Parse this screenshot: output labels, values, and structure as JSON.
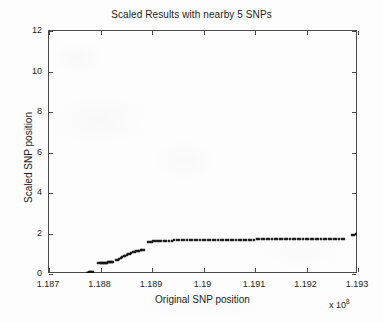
{
  "figure": {
    "background_color": "#fdfdfd",
    "axis_color": "#4a4a4a",
    "marker_color": "#141414"
  },
  "chart_data": {
    "type": "scatter",
    "title": "Scaled Results with nearby 5 SNPs",
    "xlabel": "Original SNP position",
    "ylabel": "Scaled SNP position",
    "x_exponent_label": "x 10",
    "x_exponent_power": "8",
    "xlim": [
      1.187,
      1.193
    ],
    "ylim": [
      0,
      12
    ],
    "xticks": [
      1.187,
      1.188,
      1.189,
      1.19,
      1.191,
      1.192,
      1.193
    ],
    "xticklabels": [
      "1.187",
      "1.188",
      "1.189",
      "1.19",
      "1.191",
      "1.192",
      "1.193"
    ],
    "yticks": [
      0,
      2,
      4,
      6,
      8,
      10,
      12
    ],
    "yticklabels": [
      "0",
      "2",
      "4",
      "6",
      "8",
      "10",
      "12"
    ],
    "grid": false,
    "legend": null,
    "marker": "x",
    "series": [
      {
        "name": "Scaled SNP position",
        "points": [
          [
            1.18776,
            0.02
          ],
          [
            1.18778,
            0.02
          ],
          [
            1.1878,
            0.03
          ],
          [
            1.18782,
            0.03
          ],
          [
            1.18784,
            0.04
          ],
          [
            1.18786,
            0.04
          ],
          [
            1.18788,
            0.05
          ],
          [
            1.18798,
            0.47
          ],
          [
            1.188,
            0.48
          ],
          [
            1.18802,
            0.48
          ],
          [
            1.18804,
            0.49
          ],
          [
            1.18806,
            0.49
          ],
          [
            1.18808,
            0.5
          ],
          [
            1.1881,
            0.5
          ],
          [
            1.18812,
            0.51
          ],
          [
            1.18814,
            0.51
          ],
          [
            1.18816,
            0.52
          ],
          [
            1.18818,
            0.52
          ],
          [
            1.1882,
            0.53
          ],
          [
            1.18822,
            0.53
          ],
          [
            1.18824,
            0.54
          ],
          [
            1.18826,
            0.54
          ],
          [
            1.18832,
            0.62
          ],
          [
            1.18835,
            0.66
          ],
          [
            1.18838,
            0.7
          ],
          [
            1.18841,
            0.74
          ],
          [
            1.18844,
            0.78
          ],
          [
            1.18847,
            0.82
          ],
          [
            1.1885,
            0.86
          ],
          [
            1.18853,
            0.89
          ],
          [
            1.18856,
            0.92
          ],
          [
            1.18859,
            0.96
          ],
          [
            1.18862,
            1.0
          ],
          [
            1.18865,
            1.03
          ],
          [
            1.18868,
            1.06
          ],
          [
            1.18871,
            1.08
          ],
          [
            1.18874,
            1.1
          ],
          [
            1.18877,
            1.11
          ],
          [
            1.1888,
            1.12
          ],
          [
            1.18883,
            1.13
          ],
          [
            1.18886,
            1.13
          ],
          [
            1.18895,
            1.52
          ],
          [
            1.18898,
            1.54
          ],
          [
            1.18901,
            1.55
          ],
          [
            1.18904,
            1.56
          ],
          [
            1.18908,
            1.57
          ],
          [
            1.18912,
            1.58
          ],
          [
            1.18916,
            1.58
          ],
          [
            1.1892,
            1.59
          ],
          [
            1.18925,
            1.59
          ],
          [
            1.1893,
            1.6
          ],
          [
            1.18935,
            1.6
          ],
          [
            1.1894,
            1.6
          ],
          [
            1.18945,
            1.61
          ],
          [
            1.1895,
            1.61
          ],
          [
            1.18955,
            1.61
          ],
          [
            1.1896,
            1.61
          ],
          [
            1.18965,
            1.62
          ],
          [
            1.1897,
            1.62
          ],
          [
            1.18975,
            1.62
          ],
          [
            1.1898,
            1.62
          ],
          [
            1.18985,
            1.62
          ],
          [
            1.1899,
            1.62
          ],
          [
            1.18995,
            1.63
          ],
          [
            1.19,
            1.63
          ],
          [
            1.19005,
            1.63
          ],
          [
            1.1901,
            1.63
          ],
          [
            1.19015,
            1.63
          ],
          [
            1.1902,
            1.63
          ],
          [
            1.19025,
            1.63
          ],
          [
            1.1903,
            1.64
          ],
          [
            1.19035,
            1.64
          ],
          [
            1.1904,
            1.64
          ],
          [
            1.19045,
            1.64
          ],
          [
            1.1905,
            1.64
          ],
          [
            1.19055,
            1.64
          ],
          [
            1.1906,
            1.64
          ],
          [
            1.19065,
            1.65
          ],
          [
            1.1907,
            1.65
          ],
          [
            1.19075,
            1.65
          ],
          [
            1.1908,
            1.65
          ],
          [
            1.19085,
            1.65
          ],
          [
            1.1909,
            1.65
          ],
          [
            1.19095,
            1.65
          ],
          [
            1.191,
            1.65
          ],
          [
            1.19105,
            1.66
          ],
          [
            1.1911,
            1.66
          ],
          [
            1.19115,
            1.66
          ],
          [
            1.1912,
            1.66
          ],
          [
            1.19125,
            1.66
          ],
          [
            1.1913,
            1.66
          ],
          [
            1.19135,
            1.66
          ],
          [
            1.1914,
            1.66
          ],
          [
            1.19145,
            1.67
          ],
          [
            1.1915,
            1.67
          ],
          [
            1.19155,
            1.67
          ],
          [
            1.1916,
            1.67
          ],
          [
            1.19165,
            1.67
          ],
          [
            1.1917,
            1.67
          ],
          [
            1.19175,
            1.68
          ],
          [
            1.1918,
            1.68
          ],
          [
            1.19185,
            1.68
          ],
          [
            1.1919,
            1.68
          ],
          [
            1.19195,
            1.68
          ],
          [
            1.192,
            1.68
          ],
          [
            1.19205,
            1.68
          ],
          [
            1.1921,
            1.69
          ],
          [
            1.19215,
            1.69
          ],
          [
            1.1922,
            1.69
          ],
          [
            1.19225,
            1.69
          ],
          [
            1.1923,
            1.69
          ],
          [
            1.19235,
            1.69
          ],
          [
            1.1924,
            1.69
          ],
          [
            1.19245,
            1.7
          ],
          [
            1.1925,
            1.7
          ],
          [
            1.19255,
            1.7
          ],
          [
            1.1926,
            1.7
          ],
          [
            1.19265,
            1.7
          ],
          [
            1.1927,
            1.7
          ],
          [
            1.19275,
            1.7
          ],
          [
            1.1929,
            1.88
          ],
          [
            1.19294,
            1.9
          ],
          [
            1.19298,
            1.91
          ],
          [
            1.19302,
            1.92
          ],
          [
            1.19306,
            1.93
          ],
          [
            1.1931,
            1.94
          ],
          [
            1.19314,
            1.95
          ],
          [
            1.19318,
            1.96
          ],
          [
            1.1933,
            2.08
          ],
          [
            1.19334,
            2.09
          ],
          [
            1.19338,
            2.1
          ],
          [
            1.19342,
            2.11
          ],
          [
            1.19346,
            2.11
          ],
          [
            1.1935,
            2.12
          ],
          [
            1.19355,
            2.12
          ],
          [
            1.1936,
            2.13
          ],
          [
            1.19365,
            2.13
          ],
          [
            1.1937,
            2.13
          ],
          [
            1.19375,
            2.14
          ],
          [
            1.1938,
            2.14
          ],
          [
            1.19385,
            2.14
          ],
          [
            1.1939,
            2.14
          ],
          [
            1.1941,
            2.62
          ],
          [
            1.19418,
            2.8
          ],
          [
            1.19428,
            2.92
          ],
          [
            1.19432,
            2.94
          ],
          [
            1.19436,
            2.95
          ],
          [
            1.1944,
            2.96
          ],
          [
            1.19444,
            2.97
          ],
          [
            1.19448,
            2.97
          ],
          [
            1.19452,
            2.98
          ],
          [
            1.19456,
            2.98
          ],
          [
            1.19448,
            3.18
          ],
          [
            1.1949,
            4.06
          ],
          [
            1.19494,
            4.08
          ],
          [
            1.19498,
            4.09
          ],
          [
            1.19502,
            4.1
          ],
          [
            1.19506,
            4.11
          ],
          [
            1.1951,
            4.11
          ],
          [
            1.1953,
            4.55
          ],
          [
            1.19535,
            4.57
          ],
          [
            1.1954,
            4.58
          ],
          [
            1.19545,
            4.59
          ],
          [
            1.1955,
            4.6
          ],
          [
            1.19555,
            4.6
          ],
          [
            1.1956,
            4.61
          ],
          [
            1.19565,
            4.61
          ],
          [
            1.1957,
            4.61
          ],
          [
            1.19575,
            4.62
          ],
          [
            1.1958,
            4.62
          ],
          [
            1.19585,
            4.62
          ],
          [
            1.1959,
            4.62
          ],
          [
            1.19595,
            4.63
          ],
          [
            1.196,
            4.63
          ],
          [
            1.19605,
            4.63
          ],
          [
            1.1961,
            4.63
          ],
          [
            1.19615,
            4.64
          ],
          [
            1.1962,
            4.64
          ],
          [
            1.19625,
            4.64
          ],
          [
            1.1963,
            4.64
          ],
          [
            1.19635,
            4.64
          ],
          [
            1.1964,
            4.65
          ],
          [
            1.19645,
            4.65
          ],
          [
            1.1965,
            4.65
          ],
          [
            1.19655,
            4.65
          ],
          [
            1.1966,
            4.65
          ],
          [
            1.19605,
            5.02
          ],
          [
            1.1968,
            5.52
          ],
          [
            1.19684,
            5.56
          ],
          [
            1.19688,
            5.6
          ],
          [
            1.19692,
            5.63
          ],
          [
            1.19696,
            5.66
          ],
          [
            1.197,
            5.69
          ],
          [
            1.19704,
            5.72
          ],
          [
            1.19708,
            5.74
          ],
          [
            1.19712,
            5.76
          ],
          [
            1.19716,
            5.78
          ],
          [
            1.1972,
            5.79
          ],
          [
            1.19718,
            6.46
          ],
          [
            1.19745,
            7.18
          ],
          [
            1.1975,
            7.22
          ],
          [
            1.19755,
            7.25
          ],
          [
            1.1976,
            7.28
          ],
          [
            1.19765,
            7.3
          ],
          [
            1.1977,
            7.32
          ],
          [
            1.19775,
            7.33
          ],
          [
            1.1978,
            7.34
          ],
          [
            1.19785,
            7.35
          ],
          [
            1.1979,
            7.36
          ],
          [
            1.19795,
            7.36
          ],
          [
            1.1983,
            8.54
          ],
          [
            1.19835,
            8.55
          ],
          [
            1.1984,
            8.56
          ],
          [
            1.19845,
            8.56
          ],
          [
            1.1985,
            8.57
          ],
          [
            1.19855,
            8.57
          ],
          [
            1.1986,
            8.58
          ],
          [
            1.19865,
            8.58
          ],
          [
            1.1987,
            8.58
          ],
          [
            1.19875,
            8.59
          ],
          [
            1.1988,
            8.59
          ],
          [
            1.19885,
            8.59
          ],
          [
            1.1989,
            8.6
          ],
          [
            1.19895,
            8.6
          ],
          [
            1.199,
            8.6
          ],
          [
            1.19905,
            8.61
          ],
          [
            1.1991,
            8.61
          ],
          [
            1.19915,
            8.61
          ],
          [
            1.1992,
            8.62
          ],
          [
            1.19925,
            8.62
          ],
          [
            1.1993,
            8.62
          ],
          [
            1.19935,
            8.63
          ],
          [
            1.1994,
            8.63
          ],
          [
            1.19945,
            8.64
          ],
          [
            1.1995,
            8.64
          ],
          [
            1.19955,
            8.65
          ],
          [
            1.1996,
            8.66
          ],
          [
            1.19968,
            9.06
          ],
          [
            1.19972,
            9.08
          ],
          [
            1.19976,
            9.1
          ],
          [
            1.1999,
            9.55
          ],
          [
            1.19994,
            9.58
          ],
          [
            1.19998,
            9.61
          ],
          [
            1.20002,
            9.63
          ],
          [
            1.20006,
            9.66
          ],
          [
            1.2001,
            9.68
          ],
          [
            1.20014,
            9.7
          ],
          [
            1.20018,
            9.72
          ],
          [
            1.20022,
            9.74
          ],
          [
            1.20026,
            9.76
          ],
          [
            1.2003,
            9.78
          ],
          [
            1.20034,
            9.79
          ],
          [
            1.20038,
            9.81
          ],
          [
            1.20042,
            9.82
          ],
          [
            1.20046,
            9.84
          ],
          [
            1.2005,
            9.85
          ],
          [
            1.20054,
            9.86
          ],
          [
            1.20058,
            9.87
          ],
          [
            1.20062,
            9.88
          ],
          [
            1.20066,
            9.89
          ],
          [
            1.2007,
            9.9
          ]
        ]
      }
    ]
  }
}
